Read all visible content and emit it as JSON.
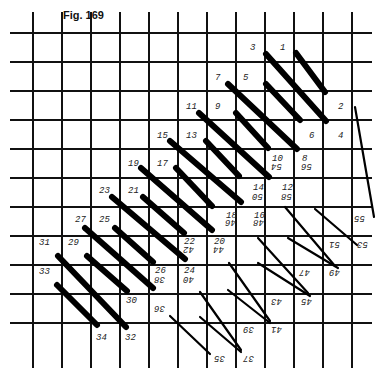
{
  "figure": {
    "title": "Fig. 169",
    "grid": {
      "x_lines": [
        33,
        62,
        91,
        120,
        149,
        178,
        207,
        236,
        265,
        294,
        323,
        352
      ],
      "y_lines": [
        33,
        62,
        91,
        120,
        149,
        178,
        207,
        236,
        265,
        294,
        323
      ],
      "color": "#111111"
    },
    "thick_stitches": [
      {
        "from": [
          296,
          53
        ],
        "to": [
          325,
          92
        ],
        "start": "1",
        "end": "2"
      },
      {
        "from": [
          266,
          54
        ],
        "to": [
          326,
          121
        ],
        "start": "3",
        "end": "4"
      },
      {
        "from": [
          266,
          84
        ],
        "to": [
          300,
          120
        ],
        "start": "5",
        "end": ""
      },
      {
        "from": [
          228,
          84
        ],
        "to": [
          297,
          149
        ],
        "start": "7",
        "end": "6"
      },
      {
        "from": [
          236,
          113
        ],
        "to": [
          268,
          148
        ],
        "start": "9",
        "end": "8"
      },
      {
        "from": [
          199,
          113
        ],
        "to": [
          269,
          177
        ],
        "start": "11",
        "end": "10"
      },
      {
        "from": [
          206,
          141
        ],
        "to": [
          239,
          176
        ],
        "start": "13",
        "end": ""
      },
      {
        "from": [
          170,
          141
        ],
        "to": [
          241,
          202
        ],
        "start": "15",
        "end": "14"
      },
      {
        "from": [
          176,
          168
        ],
        "to": [
          212,
          206
        ],
        "start": "17",
        "end": ""
      },
      {
        "from": [
          141,
          168
        ],
        "to": [
          212,
          230
        ],
        "start": "19",
        "end": "18"
      },
      {
        "from": [
          143,
          197
        ],
        "to": [
          184,
          233
        ],
        "start": "21",
        "end": ""
      },
      {
        "from": [
          112,
          197
        ],
        "to": [
          185,
          259
        ],
        "start": "23",
        "end": "22"
      },
      {
        "from": [
          115,
          228
        ],
        "to": [
          153,
          262
        ],
        "start": "25",
        "end": ""
      },
      {
        "from": [
          85,
          228
        ],
        "to": [
          153,
          288
        ],
        "start": "27",
        "end": "26"
      },
      {
        "from": [
          87,
          256
        ],
        "to": [
          127,
          291
        ],
        "start": "29",
        "end": "30"
      },
      {
        "from": [
          58,
          256
        ],
        "to": [
          126,
          327
        ],
        "start": "31",
        "end": "32"
      },
      {
        "from": [
          57,
          285
        ],
        "to": [
          97,
          325
        ],
        "start": "33",
        "end": "34"
      }
    ],
    "thin_stitches": [
      {
        "from": [
          355,
          107
        ],
        "to": [
          374,
          217
        ],
        "label": ""
      },
      {
        "from": [
          315,
          209
        ],
        "to": [
          357,
          245
        ],
        "label": ""
      },
      {
        "from": [
          285,
          207
        ],
        "to": [
          335,
          266
        ],
        "label": ""
      },
      {
        "from": [
          288,
          238
        ],
        "to": [
          338,
          268
        ],
        "label": ""
      },
      {
        "from": [
          258,
          238
        ],
        "to": [
          308,
          293
        ],
        "label": ""
      },
      {
        "from": [
          258,
          263
        ],
        "to": [
          310,
          296
        ],
        "label": ""
      },
      {
        "from": [
          229,
          263
        ],
        "to": [
          270,
          321
        ],
        "label": ""
      },
      {
        "from": [
          228,
          290
        ],
        "to": [
          270,
          323
        ],
        "label": ""
      },
      {
        "from": [
          200,
          292
        ],
        "to": [
          241,
          350
        ],
        "label": ""
      },
      {
        "from": [
          200,
          317
        ],
        "to": [
          241,
          352
        ],
        "label": ""
      },
      {
        "from": [
          170,
          316
        ],
        "to": [
          210,
          354
        ],
        "label": ""
      }
    ],
    "labels_upright": [
      {
        "text": "3",
        "x": 250,
        "y": 50
      },
      {
        "text": "1",
        "x": 280,
        "y": 50
      },
      {
        "text": "7",
        "x": 215,
        "y": 80
      },
      {
        "text": "5",
        "x": 243,
        "y": 80
      },
      {
        "text": "11",
        "x": 186,
        "y": 109
      },
      {
        "text": "9",
        "x": 215,
        "y": 109
      },
      {
        "text": "2",
        "x": 338,
        "y": 109
      },
      {
        "text": "15",
        "x": 157,
        "y": 138
      },
      {
        "text": "13",
        "x": 186,
        "y": 138
      },
      {
        "text": "6",
        "x": 309,
        "y": 138
      },
      {
        "text": "4",
        "x": 338,
        "y": 138
      },
      {
        "text": "19",
        "x": 128,
        "y": 166
      },
      {
        "text": "17",
        "x": 157,
        "y": 166
      },
      {
        "text": "10",
        "x": 272,
        "y": 161
      },
      {
        "text": "8",
        "x": 302,
        "y": 161
      },
      {
        "text": "23",
        "x": 99,
        "y": 193
      },
      {
        "text": "21",
        "x": 128,
        "y": 193
      },
      {
        "text": "14",
        "x": 253,
        "y": 190
      },
      {
        "text": "12",
        "x": 282,
        "y": 190
      },
      {
        "text": "27",
        "x": 75,
        "y": 222
      },
      {
        "text": "25",
        "x": 99,
        "y": 222
      },
      {
        "text": "18",
        "x": 226,
        "y": 218
      },
      {
        "text": "16",
        "x": 254,
        "y": 218
      },
      {
        "text": "31",
        "x": 39,
        "y": 245
      },
      {
        "text": "29",
        "x": 68,
        "y": 245
      },
      {
        "text": "22",
        "x": 184,
        "y": 244
      },
      {
        "text": "20",
        "x": 214,
        "y": 244
      },
      {
        "text": "33",
        "x": 39,
        "y": 274
      },
      {
        "text": "26",
        "x": 155,
        "y": 273
      },
      {
        "text": "24",
        "x": 184,
        "y": 273
      },
      {
        "text": "30",
        "x": 126,
        "y": 303
      },
      {
        "text": "34",
        "x": 96,
        "y": 340
      },
      {
        "text": "32",
        "x": 125,
        "y": 340
      }
    ],
    "labels_inverted": [
      {
        "text": "54",
        "x": 272,
        "y": 170
      },
      {
        "text": "56",
        "x": 302,
        "y": 170
      },
      {
        "text": "50",
        "x": 253,
        "y": 200
      },
      {
        "text": "58",
        "x": 282,
        "y": 200
      },
      {
        "text": "46",
        "x": 226,
        "y": 226
      },
      {
        "text": "48",
        "x": 254,
        "y": 226
      },
      {
        "text": "55",
        "x": 355,
        "y": 222
      },
      {
        "text": "42",
        "x": 184,
        "y": 253
      },
      {
        "text": "44",
        "x": 214,
        "y": 253
      },
      {
        "text": "51",
        "x": 330,
        "y": 248
      },
      {
        "text": "53",
        "x": 358,
        "y": 248
      },
      {
        "text": "38",
        "x": 155,
        "y": 283
      },
      {
        "text": "40",
        "x": 184,
        "y": 283
      },
      {
        "text": "47",
        "x": 300,
        "y": 276
      },
      {
        "text": "49",
        "x": 330,
        "y": 276
      },
      {
        "text": "36",
        "x": 155,
        "y": 312
      },
      {
        "text": "43",
        "x": 272,
        "y": 305
      },
      {
        "text": "45",
        "x": 302,
        "y": 305
      },
      {
        "text": "39",
        "x": 244,
        "y": 333
      },
      {
        "text": "41",
        "x": 272,
        "y": 333
      },
      {
        "text": "35",
        "x": 215,
        "y": 362
      },
      {
        "text": "37",
        "x": 244,
        "y": 362
      }
    ]
  }
}
